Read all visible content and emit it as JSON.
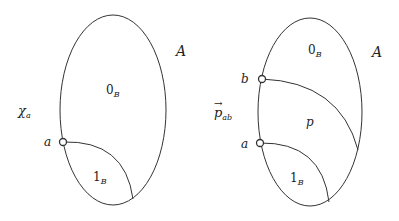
{
  "diagrams": [
    {
      "id": "left",
      "set_label": "A",
      "function_label": {
        "base": "χ",
        "sub": "a"
      },
      "regions": [
        {
          "base": "0",
          "sub": "B",
          "kind": "zero"
        },
        {
          "base": "1",
          "sub": "B",
          "kind": "one"
        }
      ],
      "points": [
        {
          "label": "a"
        }
      ]
    },
    {
      "id": "right",
      "set_label": "A",
      "function_label": {
        "base": "p",
        "sub": "ab",
        "arrow": "→"
      },
      "regions": [
        {
          "base": "0",
          "sub": "B",
          "kind": "zero"
        },
        {
          "base": "p",
          "sub": "",
          "kind": "middle"
        },
        {
          "base": "1",
          "sub": "B",
          "kind": "one"
        }
      ],
      "points": [
        {
          "label": "b"
        },
        {
          "label": "a"
        }
      ]
    }
  ],
  "colors": {
    "stroke": "#333333",
    "text": "#222222",
    "background": "#ffffff"
  }
}
